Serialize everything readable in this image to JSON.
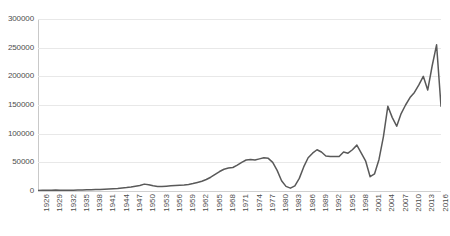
{
  "chart_data": {
    "type": "line",
    "title": "",
    "subtitle": "",
    "xlabel": "",
    "ylabel": "",
    "grid": true,
    "legend": false,
    "legend_position": "none",
    "line_color": "#595959",
    "gridline_color": "#E8E8E8",
    "axis_color": "#C9C9C9",
    "tick_label_color": "#4D4D4D",
    "ylim": [
      0,
      300000
    ],
    "ytick_values": [
      0,
      50000,
      100000,
      150000,
      200000,
      250000,
      300000
    ],
    "ytick_labels": [
      "0",
      "50000",
      "100000",
      "150000",
      "200000",
      "250000",
      "300000"
    ],
    "xlim": [
      1926,
      2017
    ],
    "xtick_labels": [
      "1926",
      "1929",
      "1932",
      "1935",
      "1938",
      "1941",
      "1944",
      "1947",
      "1950",
      "1953",
      "1956",
      "1959",
      "1962",
      "1965",
      "1968",
      "1971",
      "1974",
      "1977",
      "1980",
      "1983",
      "1986",
      "1989",
      "1992",
      "1995",
      "1998",
      "2001",
      "2004",
      "2007",
      "2010",
      "2013",
      "2016"
    ],
    "xtick_values": [
      1926,
      1929,
      1932,
      1935,
      1938,
      1941,
      1944,
      1947,
      1950,
      1953,
      1956,
      1959,
      1962,
      1965,
      1968,
      1971,
      1974,
      1977,
      1980,
      1983,
      1986,
      1989,
      1992,
      1995,
      1998,
      2001,
      2004,
      2007,
      2010,
      2013,
      2016
    ],
    "x": [
      1926,
      1927,
      1928,
      1929,
      1930,
      1931,
      1932,
      1933,
      1934,
      1935,
      1936,
      1937,
      1938,
      1939,
      1940,
      1941,
      1942,
      1943,
      1944,
      1945,
      1946,
      1947,
      1948,
      1949,
      1950,
      1951,
      1952,
      1953,
      1954,
      1955,
      1956,
      1957,
      1958,
      1959,
      1960,
      1961,
      1962,
      1963,
      1964,
      1965,
      1966,
      1967,
      1968,
      1969,
      1970,
      1971,
      1972,
      1973,
      1974,
      1975,
      1976,
      1977,
      1978,
      1979,
      1980,
      1981,
      1982,
      1983,
      1984,
      1985,
      1986,
      1987,
      1988,
      1989,
      1990,
      1991,
      1992,
      1993,
      1994,
      1995,
      1996,
      1997,
      1998,
      1999,
      2000,
      2001,
      2002,
      2003,
      2004,
      2005,
      2006,
      2007,
      2008,
      2009,
      2010,
      2011,
      2012,
      2013,
      2014,
      2015,
      2016,
      2017
    ],
    "values": [
      1000,
      1200,
      1400,
      1500,
      1600,
      1500,
      1300,
      1200,
      1400,
      1600,
      1800,
      2000,
      2200,
      2500,
      2800,
      3200,
      3600,
      4000,
      4500,
      5200,
      6000,
      7000,
      8200,
      9500,
      12000,
      11000,
      9000,
      8000,
      8000,
      8500,
      9000,
      9500,
      10000,
      10500,
      11500,
      13000,
      15000,
      17000,
      20000,
      24000,
      29000,
      34000,
      38000,
      40000,
      41000,
      45000,
      50000,
      54000,
      55000,
      54000,
      56000,
      58000,
      57000,
      50000,
      36000,
      18000,
      8000,
      5000,
      9000,
      22000,
      42000,
      58000,
      66000,
      72000,
      68000,
      61000,
      60000,
      60000,
      60000,
      68000,
      66000,
      72000,
      80000,
      66000,
      52000,
      25000,
      30000,
      55000,
      95000,
      148000,
      128000,
      113000,
      135000,
      150000,
      163000,
      172000,
      185000,
      200000,
      176000,
      218000,
      255000,
      148000
    ]
  }
}
